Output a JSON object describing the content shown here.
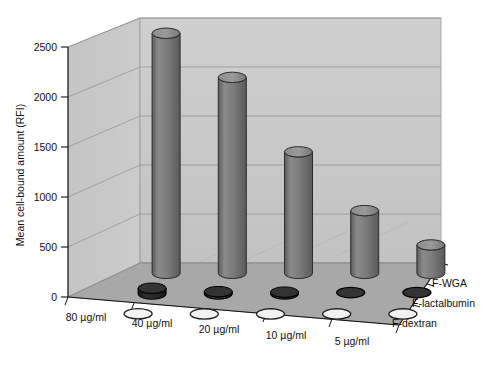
{
  "chart_data": {
    "type": "bar",
    "render": "3d-cylinder",
    "title": "",
    "subtitle": "",
    "xlabel": "",
    "ylabel": "Mean cell-bound amount (RFI)",
    "zlabel": "",
    "categories": [
      "80 µg/ml",
      "40 µg/ml",
      "20 µg/ml",
      "10 µg/ml",
      "5 µg/ml"
    ],
    "series": [
      {
        "name": "F-WGA",
        "values": [
          2450,
          2000,
          1240,
          640,
          290
        ],
        "color": "#7c7c7c"
      },
      {
        "name": "F-lactalbumin",
        "values": [
          60,
          25,
          20,
          15,
          15
        ],
        "color": "#232323"
      },
      {
        "name": "F-dextran",
        "values": [
          10,
          8,
          8,
          8,
          8
        ],
        "color": "#e8e8e8"
      }
    ],
    "ylim": [
      0,
      2500
    ],
    "yticks": [
      0,
      500,
      1000,
      1500,
      2000,
      2500
    ],
    "ytick_labels": [
      "0",
      "500",
      "1000",
      "1500",
      "2000",
      "2500"
    ],
    "grid": true,
    "legend_position": "right-inline",
    "panel_color": "#c9c9c9",
    "floor_color": "#a6a6a6",
    "axis_color": "#1a1a1a",
    "grid_color": "#8c8c8c"
  },
  "axes": {
    "y_title": "Mean cell-bound amount (RFI)",
    "y_ticks": [
      "2500",
      "2000",
      "1500",
      "1000",
      "500",
      "0"
    ],
    "x_ticks": [
      "80 µg/ml",
      "40 µg/ml",
      "20 µg/ml",
      "10 µg/ml",
      "5 µg/ml"
    ],
    "series_names": [
      "F-WGA",
      "F-lactalbumin",
      "F-dextran"
    ]
  }
}
